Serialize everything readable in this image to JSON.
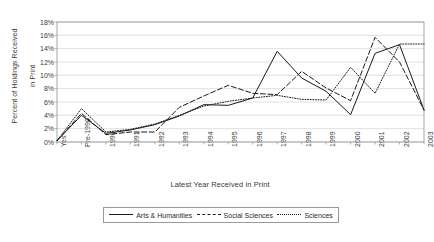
{
  "chart_data": {
    "type": "line",
    "title": "",
    "xlabel": "Latest Year Received in Print",
    "ylabel": "Percent of Holdings Received in Print",
    "ylabel_line1": "Percent of Holdings Received",
    "ylabel_line2": "in Print",
    "ylim": [
      0,
      18
    ],
    "ytick_labels": [
      "18%",
      "16%",
      "14%",
      "12%",
      "10%",
      "8%",
      "6%",
      "4%",
      "2%",
      "0%"
    ],
    "ytick_values": [
      18,
      16,
      14,
      12,
      10,
      8,
      6,
      4,
      2,
      0
    ],
    "grid": true,
    "legend_position": "bottom",
    "categories": [
      "Yes",
      "Pre-1990",
      "1990",
      "1991",
      "1992",
      "1993",
      "1994",
      "1995",
      "1996",
      "1997",
      "1998",
      "1999",
      "2000",
      "2001",
      "2002",
      "2003"
    ],
    "series": [
      {
        "name": "Arts & Humanities",
        "style": "solid",
        "color": "#1a1a1a",
        "values": [
          0.2,
          4.0,
          1.3,
          1.8,
          2.6,
          3.9,
          5.6,
          5.5,
          6.6,
          13.6,
          9.6,
          7.6,
          4.1,
          13.3,
          14.6,
          4.8
        ]
      },
      {
        "name": "Social Sciences",
        "style": "dashed",
        "color": "#1a1a1a",
        "values": [
          0.2,
          4.3,
          1.1,
          1.5,
          1.5,
          5.2,
          6.9,
          8.5,
          7.3,
          7.1,
          10.6,
          8.1,
          6.2,
          15.7,
          12.0,
          4.8
        ]
      },
      {
        "name": "Sciences",
        "style": "dotted",
        "color": "#1a1a1a",
        "values": [
          0.2,
          5.0,
          1.5,
          1.9,
          2.7,
          4.0,
          5.4,
          6.1,
          6.6,
          7.0,
          6.4,
          6.3,
          11.2,
          7.3,
          14.7,
          14.7
        ]
      }
    ]
  }
}
